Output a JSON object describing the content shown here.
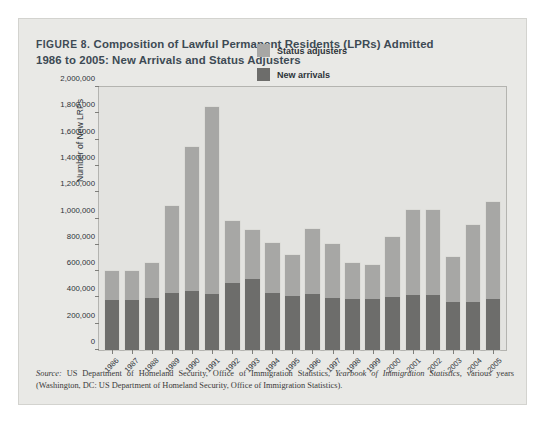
{
  "figure": {
    "label_prefix": "FIGURE 8.",
    "title_line1": "Composition of Lawful Permanent Residents (LPRs) Admitted",
    "title_line2": "1986 to 2005: New Arrivals and Status Adjusters"
  },
  "legend": {
    "items": [
      {
        "label": "Status adjusters",
        "color": "#a7a7a5"
      },
      {
        "label": "New arrivals",
        "color": "#6d6d6b"
      }
    ]
  },
  "source": {
    "lead": "Source:",
    "text_part1": " US Department of Homeland Security, Office of Immigration Statistics, ",
    "italic_title": "Yearbook of Immigration Statistics,",
    "text_part2": " various years (Washington, DC: US Department of Homeland Security, Office of Immigration Statistics)."
  },
  "chart_data": {
    "type": "bar",
    "subtype": "stacked-vertical",
    "title": "Composition of Lawful Permanent Residents (LPRs) Admitted 1986 to 2005: New Arrivals and Status Adjusters",
    "xlabel": "",
    "ylabel": "Number of New LRPs",
    "ylim": [
      0,
      2000000
    ],
    "ytick_values": [
      0,
      200000,
      400000,
      600000,
      800000,
      1000000,
      1200000,
      1400000,
      1600000,
      1800000,
      2000000
    ],
    "ytick_labels": [
      "0",
      "200,000",
      "400,000",
      "600,000",
      "800,000",
      "1,000,000",
      "1,200,000",
      "1,400,000",
      "1,600,000",
      "1,800,000",
      "2,000,000"
    ],
    "grid": false,
    "legend_position": "top-right",
    "categories": [
      "1986",
      "1987",
      "1988",
      "1989",
      "1990",
      "1991",
      "1992",
      "1993",
      "1994",
      "1995",
      "1996",
      "1997",
      "1998",
      "1999",
      "2000",
      "2001",
      "2002",
      "2003",
      "2004",
      "2005"
    ],
    "series": [
      {
        "name": "New arrivals",
        "color": "#6d6d6b",
        "values": [
          380000,
          375000,
          390000,
          430000,
          445000,
          425000,
          505000,
          535000,
          430000,
          410000,
          425000,
          395000,
          385000,
          385000,
          400000,
          415000,
          415000,
          360000,
          365000,
          385000
        ]
      },
      {
        "name": "Status adjusters",
        "color": "#a7a7a5",
        "values": [
          220000,
          225000,
          270000,
          660000,
          1090000,
          1410000,
          470000,
          370000,
          375000,
          310000,
          490000,
          405000,
          270000,
          260000,
          450000,
          645000,
          645000,
          345000,
          580000,
          735000
        ]
      }
    ],
    "totals": [
      600000,
      600000,
      660000,
      1090000,
      1535000,
      1835000,
      975000,
      905000,
      805000,
      720000,
      915000,
      800000,
      655000,
      645000,
      850000,
      1060000,
      1060000,
      705000,
      945000,
      1120000
    ]
  }
}
